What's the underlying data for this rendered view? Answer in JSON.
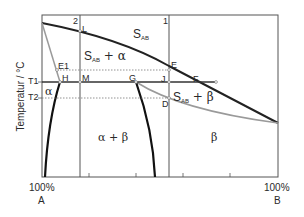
{
  "diagram": {
    "type": "phase diagram (binary system with limited solid solubility)",
    "y_axis_label": "Temperatur / °C",
    "y_ticks": [
      "T1",
      "T2"
    ],
    "x_axis": {
      "left": {
        "pct": "100%",
        "component": "A"
      },
      "right": {
        "pct": "100%",
        "component": "B"
      }
    },
    "vertical_lines": [
      {
        "id": "2",
        "label": "2"
      },
      {
        "id": "1",
        "label": "1"
      }
    ],
    "regions": {
      "liquid": {
        "base": "S",
        "sub": "AB"
      },
      "liquid_alpha": {
        "base": "S",
        "sub": "AB",
        "suffix": " + α"
      },
      "liquid_beta": {
        "base": "S",
        "sub": "AB",
        "suffix": " + β"
      },
      "alpha": "α",
      "alpha_beta": "α + β",
      "beta": "β"
    },
    "points": [
      "L",
      "E1",
      "H",
      "M",
      "G",
      "J",
      "E",
      "F",
      "D"
    ],
    "point_labels": {
      "L": "L",
      "E1": "E1",
      "H": "H",
      "M": "M",
      "G": "G",
      "J": "J",
      "E": "E",
      "F": "F",
      "D": "D"
    },
    "colors": {
      "frame": "#555555",
      "liquidus": "#222222",
      "solidus": "#9a9a9a",
      "dotted": "#777777"
    }
  }
}
